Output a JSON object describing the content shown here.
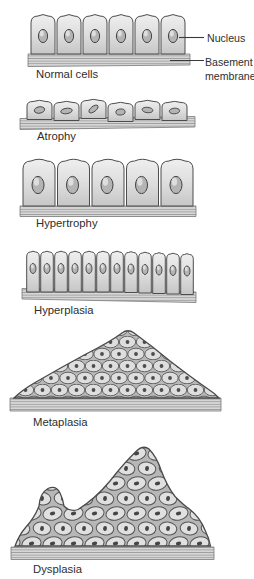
{
  "figure": {
    "sections": [
      {
        "id": "normal-cells",
        "label": "Normal cells"
      },
      {
        "id": "atrophy",
        "label": "Atrophy"
      },
      {
        "id": "hypertrophy",
        "label": "Hypertrophy"
      },
      {
        "id": "hyperplasia",
        "label": "Hyperplasia"
      },
      {
        "id": "metaplasia",
        "label": "Metaplasia"
      },
      {
        "id": "dysplasia",
        "label": "Dysplasia"
      }
    ],
    "annotations": {
      "nucleus": "Nucleus",
      "basement_line1": "Basement",
      "basement_line2": "membrane"
    },
    "colors": {
      "background": "#ffffff",
      "cell_fill": "#dcdcdc",
      "cell_highlight": "#efefef",
      "cell_outline": "#4d4d4d",
      "nucleus_fill": "#b4b4b4",
      "nucleus_outline": "#424242",
      "membrane_fill": "#d7d7d7",
      "membrane_hatch": "#949494",
      "label_text": "#2e2e2e"
    }
  }
}
